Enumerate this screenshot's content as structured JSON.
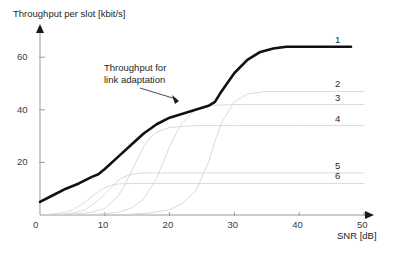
{
  "chart_data": {
    "type": "line",
    "title": "Throughput per slot [kbit/s]",
    "xlabel": "SNR [dB]",
    "ylabel": "Throughput per slot [kbit/s]",
    "xlim": [
      0,
      50
    ],
    "ylim": [
      0,
      70
    ],
    "xticks": [
      0,
      10,
      20,
      30,
      40,
      50
    ],
    "yticks": [
      20,
      40,
      60
    ],
    "grid": false,
    "legend_position": "right-inline-curve-labels",
    "annotations": [
      {
        "text_line1": "Throughput for",
        "text_line2": "link adaptation",
        "points_to_x": 22,
        "points_to_y": 45
      }
    ],
    "series": [
      {
        "name": "1",
        "label": "1",
        "style": "bold-envelope",
        "description": "Link adaptation envelope, upper hull of all modes",
        "plateau": 64,
        "x": [
          0,
          2,
          4,
          6,
          8,
          9,
          10,
          12,
          14,
          16,
          18,
          20,
          22,
          24,
          26,
          27,
          28,
          30,
          32,
          34,
          36,
          38,
          40,
          44,
          48
        ],
        "y": [
          5,
          7.5,
          10,
          12,
          14.5,
          15.5,
          17.5,
          22,
          26.5,
          31,
          34.5,
          37,
          38.5,
          40,
          41.5,
          43,
          47,
          54,
          59,
          62,
          63.3,
          64,
          64,
          64,
          64
        ]
      },
      {
        "name": "2",
        "label": "2",
        "style": "light",
        "plateau": 47,
        "transition_midpoint": 27,
        "x": [
          14,
          17,
          20,
          22,
          24,
          26,
          27,
          28,
          30,
          32,
          35,
          40,
          45,
          50
        ],
        "y": [
          0.3,
          0.8,
          2,
          4.5,
          9,
          20,
          28,
          35,
          43,
          46,
          47,
          47,
          47,
          47
        ]
      },
      {
        "name": "3",
        "label": "3",
        "style": "light",
        "plateau": 42,
        "transition_midpoint": 20,
        "x": [
          9,
          12,
          14,
          16,
          18,
          19,
          20,
          21,
          22,
          24,
          26,
          30,
          35,
          40,
          45,
          50
        ],
        "y": [
          0.3,
          1,
          2.5,
          6,
          14,
          20,
          26,
          31,
          35,
          40,
          41.6,
          42,
          42,
          42,
          42,
          42
        ]
      },
      {
        "name": "4",
        "label": "4",
        "style": "light",
        "plateau": 34,
        "transition_midpoint": 15,
        "x": [
          5,
          8,
          10,
          12,
          13,
          14,
          15,
          16,
          17,
          18,
          20,
          24,
          30,
          40,
          50
        ],
        "y": [
          0.3,
          1,
          2.5,
          7,
          11,
          16,
          21,
          26,
          29.5,
          31.5,
          33.3,
          34,
          34,
          34,
          34
        ]
      },
      {
        "name": "5",
        "label": "5",
        "style": "light",
        "plateau": 16,
        "transition_midpoint": 11,
        "x": [
          3,
          5,
          7,
          9,
          10,
          11,
          12,
          13,
          14,
          16,
          20,
          30,
          40,
          50
        ],
        "y": [
          0.2,
          0.7,
          2,
          5.5,
          8,
          10.5,
          13,
          14.5,
          15.4,
          16,
          16,
          16,
          16,
          16
        ]
      },
      {
        "name": "6",
        "label": "6",
        "style": "light",
        "plateau": 12,
        "transition_midpoint": 9,
        "x": [
          1,
          3,
          5,
          7,
          8,
          9,
          10,
          11,
          12,
          14,
          18,
          30,
          40,
          50
        ],
        "y": [
          0.2,
          0.6,
          1.8,
          5,
          7,
          8.8,
          10.3,
          11.3,
          11.8,
          12,
          12,
          12,
          12,
          12
        ]
      }
    ]
  },
  "axes": {
    "y_title": "Throughput per slot [kbit/s]",
    "x_title": "SNR [dB]",
    "x_tick_labels": [
      "0",
      "10",
      "20",
      "30",
      "40",
      "50"
    ],
    "y_tick_labels": [
      "20",
      "40",
      "60"
    ]
  },
  "annotation": {
    "line1": "Throughput for",
    "line2": "link adaptation"
  },
  "curve_labels": [
    "1",
    "2",
    "3",
    "4",
    "5",
    "6"
  ],
  "colors": {
    "axis": "#9a9a9a",
    "bold_curve": "#111111",
    "light_curve": "#d6d6d6",
    "text": "#231f20",
    "background": "#ffffff"
  }
}
